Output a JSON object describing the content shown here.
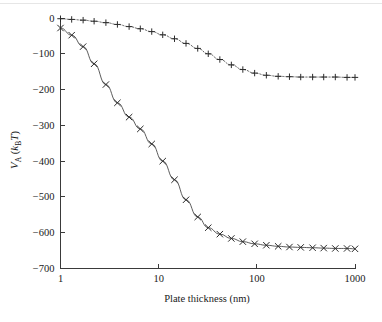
{
  "figure": {
    "background_color": "#ffffff",
    "ink_color": "#2b2b2b",
    "top_rule_color": "#e6e6e6"
  },
  "chart_data": {
    "type": "line",
    "title": "",
    "subtitle": "",
    "xlabel": "Plate thickness (nm)",
    "ylabel": "V_A (k_BT)",
    "ylabel_parts": {
      "symbol": "V",
      "symbol_sub": "A",
      "unit_open": " (",
      "unit_k": "k",
      "unit_k_sub": "B",
      "unit_T": "T",
      "unit_close": ")"
    },
    "xscale": "log",
    "yscale": "linear",
    "xlim": [
      1,
      1000
    ],
    "ylim": [
      -700,
      0
    ],
    "grid": false,
    "legend": "none",
    "xticks": [
      1,
      10,
      100,
      1000
    ],
    "xtick_labels": [
      "1",
      "10",
      "100",
      "1000"
    ],
    "yticks": [
      0,
      -100,
      -200,
      -300,
      -400,
      -500,
      -600,
      -700
    ],
    "ytick_labels": [
      "0",
      "−100",
      "−200",
      "−300",
      "−400",
      "−500",
      "−600",
      "−700"
    ],
    "series": [
      {
        "name": "thick-plate interaction",
        "marker": "x",
        "linestyle": "solid",
        "color": "#4a4a4a",
        "x": [
          1.0,
          1.3,
          1.7,
          2.2,
          2.9,
          3.8,
          5.0,
          6.5,
          8.5,
          11.0,
          14.5,
          19.0,
          25.0,
          32.0,
          42.0,
          55.0,
          72.0,
          95.0,
          125.0,
          165.0,
          215.0,
          280.0,
          370.0,
          480.0,
          630.0,
          830.0,
          1000.0
        ],
        "y": [
          -28,
          -48,
          -80,
          -128,
          -186,
          -237,
          -277,
          -310,
          -352,
          -400,
          -452,
          -508,
          -556,
          -586,
          -604,
          -616,
          -625,
          -631,
          -635,
          -638,
          -640,
          -641,
          -642,
          -643,
          -644,
          -644,
          -645
        ]
      },
      {
        "name": "thin-plate interaction",
        "marker": "+",
        "linestyle": "dotted",
        "color": "#4a4a4a",
        "x": [
          1.0,
          1.3,
          1.7,
          2.2,
          2.9,
          3.8,
          5.0,
          6.5,
          8.5,
          11.0,
          14.5,
          19.0,
          25.0,
          32.0,
          42.0,
          55.0,
          72.0,
          95.0,
          125.0,
          165.0,
          215.0,
          280.0,
          370.0,
          480.0,
          630.0,
          830.0,
          1000.0
        ],
        "y": [
          -2,
          -4,
          -6,
          -9,
          -13,
          -18,
          -24,
          -30,
          -38,
          -47,
          -58,
          -71,
          -85,
          -100,
          -116,
          -131,
          -144,
          -154,
          -160,
          -163,
          -164,
          -165,
          -165,
          -165,
          -165,
          -166,
          -166
        ]
      }
    ],
    "annotations": []
  },
  "caption": {
    "ghost_text": ""
  }
}
